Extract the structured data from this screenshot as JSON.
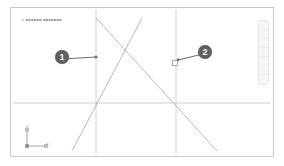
{
  "document": {
    "label": "a  ■■■■■■  ■■■■■■■",
    "label_legible": false
  },
  "callouts": [
    {
      "id": "1",
      "number": "1",
      "target": "left-reference-line"
    },
    {
      "id": "2",
      "number": "2",
      "target": "right-reference-line-handle"
    }
  ],
  "axis_indicator": {
    "name": "axis-tripod",
    "y_label": "Y",
    "x_label": "X"
  },
  "side_toolbar": {
    "name": "vertical-toolbar",
    "cells": [
      "",
      "",
      "",
      "",
      "",
      "",
      ""
    ]
  },
  "colors": {
    "frame_border": "#c9c9c9",
    "canvas_background": "#ffffff",
    "geometry_line": "#a8a8ad",
    "reference_line": "#e2e2e4",
    "callout_fill": "#5f5f5f",
    "callout_text": "#ffffff",
    "label_text": "#9a9a9a"
  },
  "geometry": {
    "reference_lines_vertical": [
      {
        "name": "left-reference-line",
        "x": 85
      },
      {
        "name": "right-reference-line",
        "x": 165
      }
    ],
    "reference_lines_horizontal": [
      {
        "name": "ground-line",
        "y": 95
      }
    ],
    "diagonals": [
      {
        "name": "diagonal-down-right",
        "x1": 85,
        "y1": 10,
        "x2": 206,
        "y2": 143
      },
      {
        "name": "diagonal-down-left",
        "x1": 131,
        "y1": 10,
        "x2": 61,
        "y2": 143
      }
    ],
    "nodes": [
      {
        "name": "leader-endpoint-dot",
        "x": 85,
        "y": 49,
        "shape": "dot"
      },
      {
        "name": "selection-handle-square",
        "x": 165,
        "y": 52,
        "shape": "square"
      }
    ]
  }
}
